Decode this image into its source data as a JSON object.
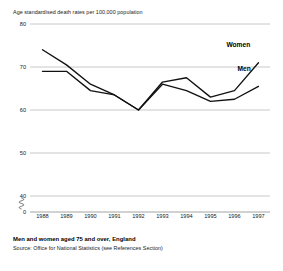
{
  "chart_data": {
    "type": "line",
    "title": "Age standardised death rates per 100,000 population",
    "xlabel": "",
    "ylabel": "",
    "categories": [
      "1988",
      "1989",
      "1990",
      "1991",
      "1992",
      "1993",
      "1994",
      "1995",
      "1996",
      "1997"
    ],
    "x": [
      1988,
      1989,
      1990,
      1991,
      1992,
      1993,
      1994,
      1995,
      1996,
      1997
    ],
    "series": [
      {
        "name": "Women",
        "values": [
          74.0,
          70.5,
          66.0,
          63.5,
          60.0,
          66.5,
          67.5,
          63.0,
          64.5,
          71.0
        ]
      },
      {
        "name": "Men",
        "values": [
          69.0,
          69.0,
          64.5,
          63.5,
          60.0,
          66.0,
          64.5,
          62.0,
          62.5,
          65.5
        ]
      }
    ],
    "ylim": [
      40,
      80
    ],
    "yticks": [
      80,
      70,
      60,
      50,
      40,
      0
    ],
    "ytick_labels": [
      "80",
      "70",
      "60",
      "50",
      "40",
      "0"
    ],
    "axis_break": true,
    "axis_break_between": [
      40,
      0
    ],
    "grid": true,
    "grid_axis": "y",
    "legend": "inline-right",
    "legend_entries": [
      "Women",
      "Men"
    ],
    "line_color": "#111111"
  },
  "footer": {
    "title": "Men and women aged 75 and over, England",
    "source": "Source: Office for National Statistics (see References Section)"
  },
  "labels": {
    "women": "Women",
    "men": "Men"
  }
}
